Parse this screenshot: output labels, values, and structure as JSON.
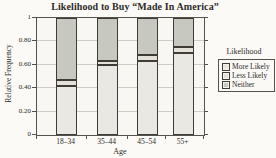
{
  "title": "Likelihood to Buy “Made In America”",
  "colors": {
    "page_bg": "#fbfaf7",
    "plot_bg": "#f8f7f3",
    "frame": "#55524c",
    "gridline": "#d0cdc6",
    "bar_border": "#3f3c37",
    "more_likely_fill": "#eae8e2",
    "less_likely_fill": "#e3e1d8",
    "neither_fill": "#c7c9c1"
  },
  "chart_data": {
    "type": "bar",
    "stacked": true,
    "title": "Likelihood to Buy “Made In America”",
    "xlabel": "Age",
    "ylabel": "Relative Frequency",
    "categories": [
      "18–34",
      "35–44",
      "45–54",
      "55+"
    ],
    "series": [
      {
        "name": "More Likely",
        "values": [
          0.42,
          0.6,
          0.63,
          0.7
        ],
        "color": "#eae8e2"
      },
      {
        "name": "Less Likely",
        "values": [
          0.05,
          0.03,
          0.05,
          0.05
        ],
        "color": "#e3e1d8"
      },
      {
        "name": "Neither",
        "values": [
          0.53,
          0.37,
          0.32,
          0.25
        ],
        "color": "#c7c9c1"
      }
    ],
    "ylim": [
      0,
      1
    ],
    "yticks": [
      "0",
      "0.20",
      "0.40",
      "0.60",
      "0.80",
      "1"
    ],
    "grid": true,
    "legend_title": "Likelihood",
    "legend_position": "right"
  }
}
